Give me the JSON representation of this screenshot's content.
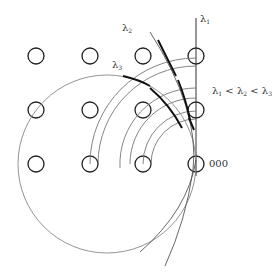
{
  "labels": {
    "lambda1": "λ",
    "lambda1_sub": "1",
    "lambda2": "λ",
    "lambda2_sub": "2",
    "lambda3": "λ",
    "lambda3_sub": "3",
    "ordering": {
      "a": "λ",
      "a_sub": "1",
      "lt1": " < ",
      "b": "λ",
      "b_sub": "2",
      "lt2": " < ",
      "c": "λ",
      "c_sub": "3"
    },
    "origin": "000"
  },
  "grid": {
    "columns_x": [
      36,
      90,
      143,
      196
    ],
    "rows_y": [
      56,
      110,
      164
    ],
    "node_radius": 8
  },
  "colors": {
    "stroke": "#222222",
    "thin": "#777777"
  }
}
